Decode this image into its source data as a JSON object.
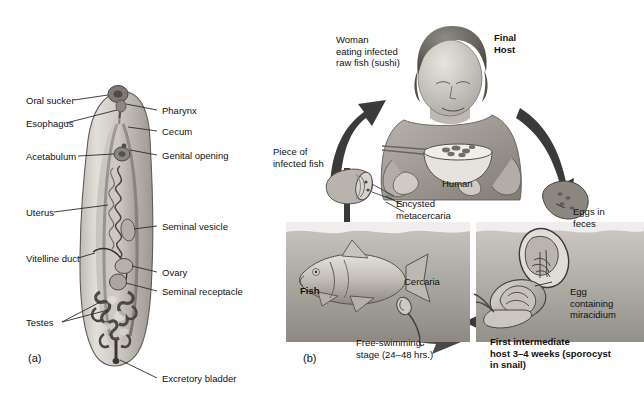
{
  "figure": {
    "panel_a_id": "(a)",
    "panel_b_id": "(b)",
    "palette": {
      "ink": "#111111",
      "leader_line": "#2b2b2b",
      "body_light": "#d5d2cd",
      "body_mid": "#a8a49d",
      "body_dark": "#6f6b64",
      "water_light": "#cfcdc8",
      "water_dark": "#9a968f",
      "arrow_dark": "#3a3a38",
      "background": "#ffffff"
    }
  },
  "panel_a": {
    "title": "Trematode (liver fluke) anatomy",
    "labels_left": [
      {
        "id": "oral-sucker",
        "text": "Oral sucker"
      },
      {
        "id": "esophagus",
        "text": "Esophagus"
      },
      {
        "id": "acetabulum",
        "text": "Acetabulum"
      },
      {
        "id": "uterus",
        "text": "Uterus"
      },
      {
        "id": "vitelline-duct",
        "text": "Vitelline duct"
      },
      {
        "id": "testes",
        "text": "Testes"
      }
    ],
    "labels_right": [
      {
        "id": "pharynx",
        "text": "Pharynx"
      },
      {
        "id": "cecum",
        "text": "Cecum"
      },
      {
        "id": "genital-opening",
        "text": "Genital opening"
      },
      {
        "id": "seminal-vesicle",
        "text": "Seminal vesicle"
      },
      {
        "id": "ovary",
        "text": "Ovary"
      },
      {
        "id": "seminal-receptacle",
        "text": "Seminal receptacle"
      },
      {
        "id": "excretory-bladder",
        "text": "Excretory bladder"
      }
    ]
  },
  "panel_b": {
    "title": "Life cycle",
    "labels": [
      {
        "id": "woman-eating",
        "text": "Woman\neating infected\nraw fish (sushi)",
        "bold": false
      },
      {
        "id": "final-host",
        "text": "Final\nHost",
        "bold": true
      },
      {
        "id": "human",
        "text": "Human",
        "bold": false
      },
      {
        "id": "piece-of-infected-fish",
        "text": "Piece of\ninfected fish",
        "bold": false
      },
      {
        "id": "encysted-metacercaria",
        "text": "Encysted\nmetacercaria",
        "bold": false
      },
      {
        "id": "fish",
        "text": "Fish",
        "bold": true
      },
      {
        "id": "cercaria",
        "text": "Cercaria",
        "bold": false
      },
      {
        "id": "free-swimming-stage",
        "text": "Free-swimming\nstage (24–48 hrs.)",
        "bold": false
      },
      {
        "id": "eggs-in-feces",
        "text": "Eggs in\nfeces",
        "bold": false
      },
      {
        "id": "egg-containing-miracidium",
        "text": "Egg\ncontaining\nmiracidium",
        "bold": false
      },
      {
        "id": "first-intermediate-host",
        "text": "First intermediate\nhost 3–4 weeks (sporocyst\nin snail)",
        "bold": true
      }
    ]
  }
}
